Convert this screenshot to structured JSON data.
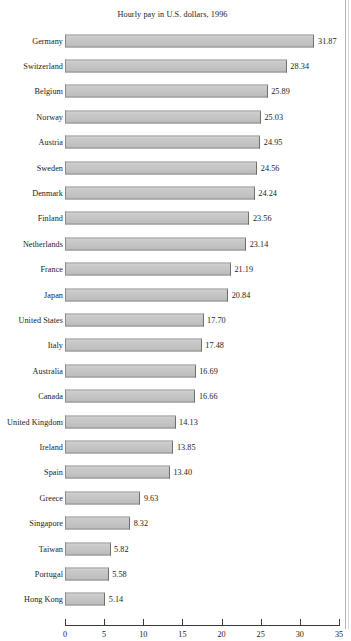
{
  "chart_data": {
    "type": "bar",
    "orientation": "horizontal",
    "title": "Hourly pay in U.S. dollars, 1996",
    "xlabel": "",
    "ylabel": "",
    "xlim": [
      0,
      35
    ],
    "xticks": [
      0,
      5,
      10,
      15,
      20,
      25,
      30,
      35
    ],
    "xtick_labels": [
      "0",
      "5",
      "10",
      "15",
      "20",
      "25",
      "30",
      "35"
    ],
    "grid": false,
    "legend": false,
    "bar_color": "#c6c6c6",
    "bar_edge_color": "#6e6e6e",
    "value_label_format": "2 decimals",
    "sorted": "descending",
    "categories": [
      "Germany",
      "Switzerland",
      "Belgium",
      "Norway",
      "Austria",
      "Sweden",
      "Denmark",
      "Finland",
      "Netherlands",
      "France",
      "Japan",
      "United States",
      "Italy",
      "Australia",
      "Canada",
      "United Kingdom",
      "Ireland",
      "Spain",
      "Greece",
      "Singapore",
      "Taiwan",
      "Portugal",
      "Hong Kong"
    ],
    "values": [
      31.87,
      28.34,
      25.89,
      25.03,
      24.95,
      24.56,
      24.24,
      23.56,
      23.14,
      21.19,
      20.84,
      17.7,
      17.48,
      16.69,
      16.66,
      14.13,
      13.85,
      13.4,
      9.63,
      8.32,
      5.82,
      5.58,
      5.14
    ],
    "value_labels": [
      "31.87",
      "28.34",
      "25.89",
      "25.03",
      "24.95",
      "24.56",
      "24.24",
      "23.56",
      "23.14",
      "21.19",
      "20.84",
      "17.70",
      "17.48",
      "16.69",
      "16.66",
      "14.13",
      "13.85",
      "13.40",
      "9.63",
      "8.32",
      "5.82",
      "5.58",
      "5.14"
    ]
  }
}
